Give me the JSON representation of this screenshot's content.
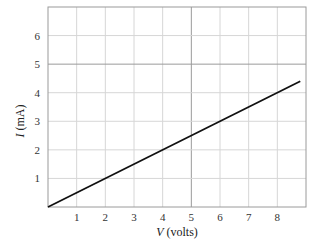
{
  "chart_data": {
    "type": "line",
    "title": "",
    "xlabel_var": "V",
    "xlabel_unit": " (volts)",
    "ylabel_var": "I",
    "ylabel_unit": " (mA)",
    "xlim": [
      0,
      9
    ],
    "ylim": [
      0,
      7
    ],
    "grid": true,
    "highlighted_gridlines": {
      "x": 5,
      "y": 5
    },
    "x_ticks": [
      1,
      2,
      3,
      4,
      5,
      6,
      7,
      8
    ],
    "y_ticks": [
      1,
      2,
      3,
      4,
      5,
      6
    ],
    "series": [
      {
        "name": "I vs V",
        "x": [
          0,
          8.8
        ],
        "y": [
          0,
          4.4
        ],
        "color": "#111111"
      }
    ]
  },
  "colors": {
    "grid": "#d6d6d6",
    "grid_major": "#9a9a9a",
    "axis": "#9a9a9a",
    "line": "#111111"
  }
}
